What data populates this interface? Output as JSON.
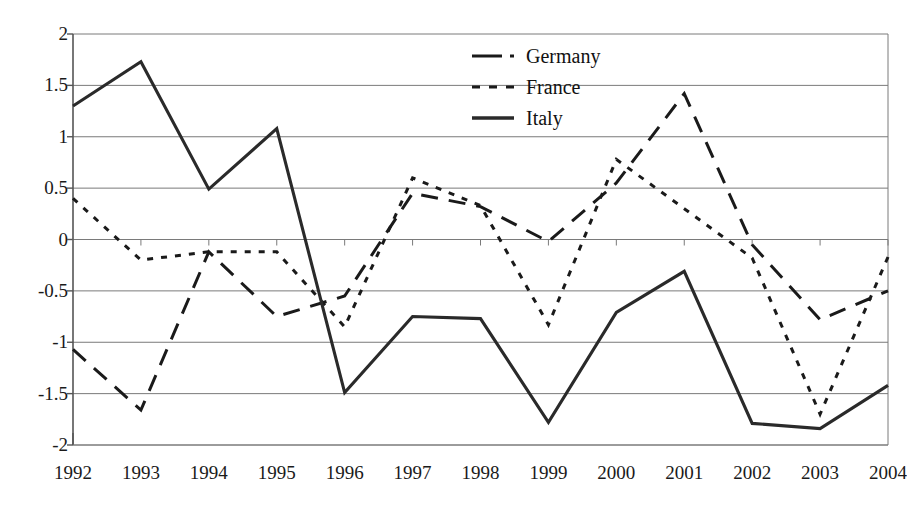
{
  "chart_data": {
    "type": "line",
    "title": "",
    "subtitle": "",
    "xlabel": "",
    "ylabel": "",
    "categories": [
      "1992",
      "1993",
      "1994",
      "1995",
      "1996",
      "1997",
      "1998",
      "1999",
      "2000",
      "2001",
      "2002",
      "2003",
      "2004"
    ],
    "x": [
      1992,
      1993,
      1994,
      1995,
      1996,
      1997,
      1998,
      1999,
      2000,
      2001,
      2002,
      2003,
      2004
    ],
    "ylim": [
      -2,
      2
    ],
    "xlim": [
      1992,
      2004
    ],
    "y_ticks": [
      2,
      1.5,
      1,
      0.5,
      0,
      -0.5,
      -1,
      -1.5,
      -2
    ],
    "y_tick_labels": [
      "2",
      "1.5",
      "1",
      "0.5",
      "0",
      "-0.5",
      "-1",
      "-1.5",
      "-2"
    ],
    "grid": "horizontal",
    "legend_position": "top-center",
    "series": [
      {
        "name": "Germany",
        "style": "long-dash",
        "color": "#1a1a1a",
        "values": [
          -1.07,
          -1.66,
          -0.12,
          -0.75,
          -0.55,
          0.45,
          0.32,
          -0.02,
          0.55,
          1.42,
          -0.05,
          -0.78,
          -0.5
        ]
      },
      {
        "name": "France",
        "style": "dotted",
        "color": "#1a1a1a",
        "values": [
          0.4,
          -0.2,
          -0.12,
          -0.12,
          -0.85,
          0.6,
          0.33,
          -0.83,
          0.78,
          0.3,
          -0.18,
          -1.7,
          -0.17
        ]
      },
      {
        "name": "Italy",
        "style": "solid",
        "color": "#2a2a2a",
        "values": [
          1.3,
          1.73,
          0.49,
          1.08,
          -1.49,
          -0.75,
          -0.77,
          -1.78,
          -0.71,
          -0.31,
          -1.79,
          -1.84,
          -1.42
        ]
      }
    ]
  },
  "legend": {
    "entries": [
      {
        "label": "Germany"
      },
      {
        "label": "France"
      },
      {
        "label": "Italy"
      }
    ]
  },
  "colors": {
    "axis": "#555555",
    "grid": "#7a7a7a",
    "text": "#1a1a1a",
    "series_ink": "#222222"
  }
}
